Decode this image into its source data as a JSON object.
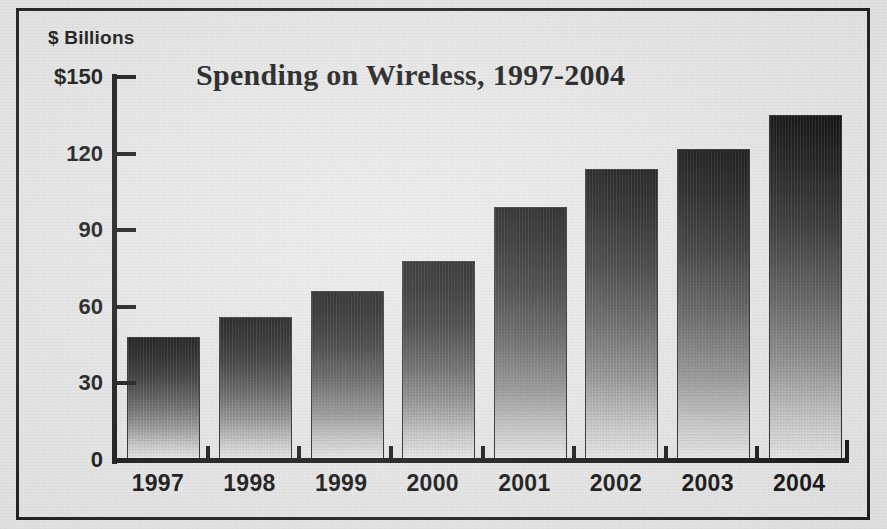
{
  "figure": {
    "axis_unit_label": "$ Billions",
    "border_color": "#1d1d1d",
    "background_color": "#eaeaea",
    "bar_top_color": "#050505",
    "bar_bottom_color": "#efefef"
  },
  "chart_data": {
    "type": "bar",
    "title": "Spending on Wireless, 1997-2004",
    "xlabel": "",
    "ylabel": "$ Billions",
    "categories": [
      "1997",
      "1998",
      "1999",
      "2000",
      "2001",
      "2002",
      "2003",
      "2004"
    ],
    "values": [
      48,
      56,
      66,
      78,
      99,
      114,
      122,
      135
    ],
    "ylim": [
      0,
      150
    ],
    "yticks": [
      0,
      30,
      60,
      90,
      120,
      150
    ],
    "ytick_labels": [
      "0",
      "30",
      "60",
      "90",
      "120",
      "$150"
    ],
    "grid": false,
    "legend": null,
    "annotations": []
  }
}
